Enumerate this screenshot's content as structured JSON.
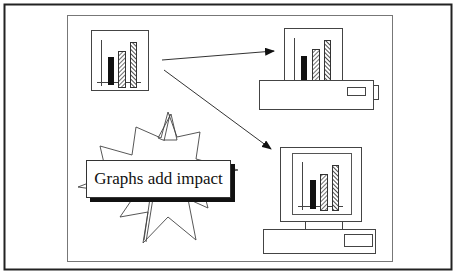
{
  "diagram": {
    "caption": "Graphs add impact",
    "source_chart": {
      "bars": [
        "solid",
        "hatched",
        "hatched-dense"
      ]
    },
    "targets": [
      {
        "name": "printer",
        "label": ""
      },
      {
        "name": "computer",
        "label": ""
      }
    ],
    "colors": {
      "frame": "#222222",
      "inner_frame": "#666666",
      "line": "#333333",
      "shadow": "#111111",
      "background": "#ffffff"
    }
  }
}
